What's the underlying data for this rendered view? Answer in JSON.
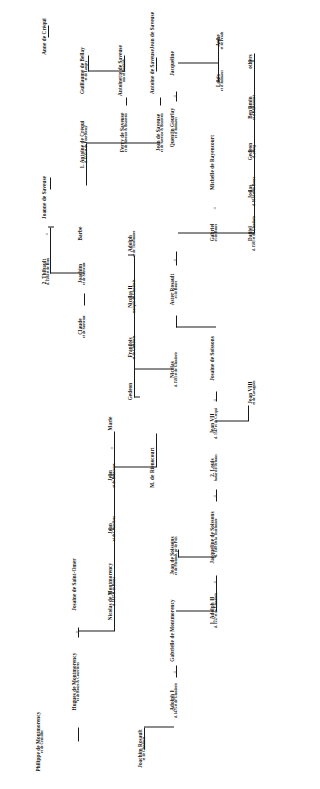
{
  "chart": {
    "type": "genealogy-tree",
    "orientation": "rotated-90-ccw",
    "marriage_symbol": "=",
    "line_color": "#1a1a1a"
  },
  "people": [
    {
      "id": "p1",
      "name": "Philippe de Montmorency",
      "sub": "et de Croisilles"
    },
    {
      "id": "p2",
      "name": "Hugues de Montmorency",
      "sub": "et de Bours & Courrières"
    },
    {
      "id": "p3",
      "name": "Josaine de Saint-Omer",
      "sub": ""
    },
    {
      "id": "p4",
      "name": "Nicolas de Montmorency",
      "sub": "d. 1437\net de Bours"
    },
    {
      "id": "p5",
      "name": "Jean",
      "sub": "et de Courrières"
    },
    {
      "id": "p6",
      "name": "Jean",
      "sub": "et de Renescure"
    },
    {
      "id": "p7",
      "name": "Marie",
      "sub": ""
    },
    {
      "id": "p8",
      "name": "M. de Rienocourt",
      "sub": ""
    },
    {
      "id": "p9",
      "name": "Joachim Rosault",
      "sub": "et de Glanderie"
    },
    {
      "id": "p10",
      "name": "Adolph I",
      "sub": "d. 1475\net de Glanderie"
    },
    {
      "id": "p11",
      "name": "Gabrielle de Montmorency",
      "sub": ""
    },
    {
      "id": "p12",
      "name": "Jean de Soissons",
      "sub": "et de Moismlt, pr de Poix"
    },
    {
      "id": "p13",
      "name": "1. Adolph II",
      "sub": "d. 1557\net de Glanderie"
    },
    {
      "id": "p14",
      "name": "Jacqueline de Soissons",
      "sub": "d. 1569\nDe la Tisselonnee"
    },
    {
      "id": "p15",
      "name": "2. Louis",
      "sub": "batard d'Orleans"
    },
    {
      "id": "p16",
      "name": "Jean VII",
      "sub": "d. 1547\net de Crequi"
    },
    {
      "id": "p17",
      "name": "Josaine de Soissons",
      "sub": ""
    },
    {
      "id": "p18",
      "name": "Jean VIII",
      "sub": "et de Cavagnies"
    },
    {
      "id": "p19",
      "name": "Aster Rosault",
      "sub": "et de Bours"
    },
    {
      "id": "p20",
      "name": "Gabriel",
      "sub": "et de Bours"
    },
    {
      "id": "p21",
      "name": "Michelle de Rayencourt",
      "sub": ""
    },
    {
      "id": "p22",
      "name": "Quentin Gourlay",
      "sub": "et d'Animaux"
    },
    {
      "id": "p23",
      "name": "Jacqueline",
      "sub": ""
    },
    {
      "id": "p24",
      "name": "Louis",
      "sub": "et d'Animaux"
    },
    {
      "id": "p25",
      "name": "Anne",
      "sub": "et de Pende"
    },
    {
      "id": "p26",
      "name": "Daniel",
      "sub": "d. 1581\net de Glanderie"
    },
    {
      "id": "p27",
      "name": "Josias",
      "sub": "d. 1614\net de Bours"
    },
    {
      "id": "p28",
      "name": "Gedeon",
      "sub": "d. young"
    },
    {
      "id": "p29",
      "name": "Benjamin",
      "sub": "et d'Rayencourt"
    },
    {
      "id": "p30",
      "name": "others",
      "sub": ""
    },
    {
      "id": "p31",
      "name": "Nicolas",
      "sub": "d. 1583\net de Glanderie"
    },
    {
      "id": "p32",
      "name": "Gedeon",
      "sub": ""
    },
    {
      "id": "p33",
      "name": "Francois",
      "sub": "et de Glanderie"
    },
    {
      "id": "p34",
      "name": "Nicolas II",
      "sub": "marquis de Glanderie"
    },
    {
      "id": "p35",
      "name": "Adolph",
      "sub": "et de Tisselonnee"
    },
    {
      "id": "p36",
      "name": "Claude",
      "sub": "et de Sauveuse"
    },
    {
      "id": "p37",
      "name": "Joachim",
      "sub": "et de Sauveuse"
    },
    {
      "id": "p38",
      "name": "Barbe",
      "sub": ""
    },
    {
      "id": "p39",
      "name": "2. Thibault",
      "sub": "d. 1584\net de Riou"
    },
    {
      "id": "p40",
      "name": "Joanne de Saveuse",
      "sub": ""
    },
    {
      "id": "p41",
      "name": "1. Antoine de Créqui",
      "sub": "d. 1535\net de Pont-Remy"
    },
    {
      "id": "p42",
      "name": "Ferry de Saveuse",
      "sub": "et de Saveuse & Beauvois"
    },
    {
      "id": "p43",
      "name": "Jean de Saveuse",
      "sub": "et de Saveuse & Beauvois"
    },
    {
      "id": "p44",
      "name": "Antoine de Saveuse",
      "sub": ""
    },
    {
      "id": "p45",
      "name": "Jean de Saveuse",
      "sub": ""
    },
    {
      "id": "p46",
      "name": "Antoinette de Saveuse",
      "sub": "son of Dunkirk"
    },
    {
      "id": "p47",
      "name": "Guillaume de Bellay",
      "sub": "et de Langey"
    },
    {
      "id": "p48",
      "name": "Anne de Créqui",
      "sub": ""
    }
  ]
}
